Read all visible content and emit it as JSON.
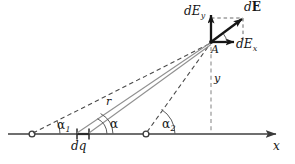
{
  "figure": {
    "colors": {
      "ink": "#161616",
      "axis": "#6f6f6f",
      "ray": "#8a8a8a",
      "dashed": "#4a4a4a",
      "background": "#ffffff"
    },
    "labels": {
      "dE_y": {
        "base": "dE",
        "sub": "y"
      },
      "dE_vector": {
        "base": "d",
        "vector": "E"
      },
      "dE_x": {
        "base": "dE",
        "sub": "x"
      },
      "point_A": "A",
      "distance_y": "y",
      "radius_r": "r",
      "angle_1": {
        "base": "α",
        "sub": "1"
      },
      "angle": {
        "base": "α",
        "sub": ""
      },
      "angle_2": {
        "base": "α",
        "sub": "2"
      },
      "charge_element": "dq",
      "axis_x": "x"
    },
    "geometry": {
      "point_A": {
        "x": 211,
        "y": 42
      },
      "axis_y_position": 134,
      "axis_start_x": 8,
      "axis_end_x": 281,
      "marker_left": {
        "x": 32,
        "y": 134
      },
      "marker_right": {
        "x": 146,
        "y": 134
      },
      "dq_tick_left_x": 77,
      "dq_tick_right_x": 89,
      "dE_tip": {
        "x": 243,
        "y": 18
      },
      "dEy_tip": {
        "x": 211,
        "y": 16
      },
      "dEx_tip": {
        "x": 234,
        "y": 42
      }
    }
  }
}
